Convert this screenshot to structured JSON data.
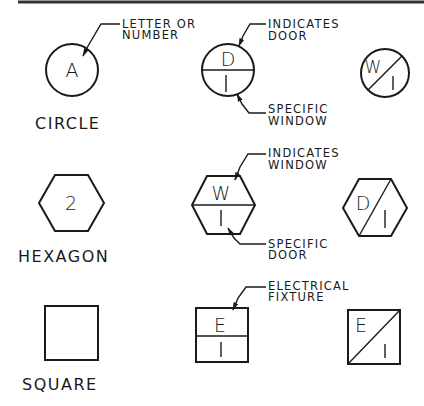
{
  "rows": [
    {
      "shape": "circle",
      "caption": "CIRCLE",
      "basic": {
        "symbol": "A",
        "leader_label_1": "LETTER OR",
        "leader_label_2": "NUMBER"
      },
      "split_horizontal": {
        "top": "D",
        "bottom": "1",
        "top_label_1": "INDICATES",
        "top_label_2": "DOOR",
        "bottom_label_1": "SPECIFIC",
        "bottom_label_2": "WINDOW"
      },
      "split_diagonal": {
        "top": "W",
        "bottom": "1"
      }
    },
    {
      "shape": "hexagon",
      "caption": "HEXAGON",
      "basic": {
        "symbol": "2"
      },
      "split_horizontal": {
        "top": "W",
        "bottom": "1",
        "top_label_1": "INDICATES",
        "top_label_2": "WINDOW",
        "bottom_label_1": "SPECIFIC",
        "bottom_label_2": "DOOR"
      },
      "split_diagonal": {
        "top": "D",
        "bottom": "1"
      }
    },
    {
      "shape": "square",
      "caption": "SQUARE",
      "basic": {
        "symbol": ""
      },
      "split_horizontal": {
        "top": "E",
        "bottom": "1",
        "top_label_1": "ELECTRICAL",
        "top_label_2": "FIXTURE"
      },
      "split_diagonal": {
        "top": "E",
        "bottom": "1"
      }
    }
  ]
}
